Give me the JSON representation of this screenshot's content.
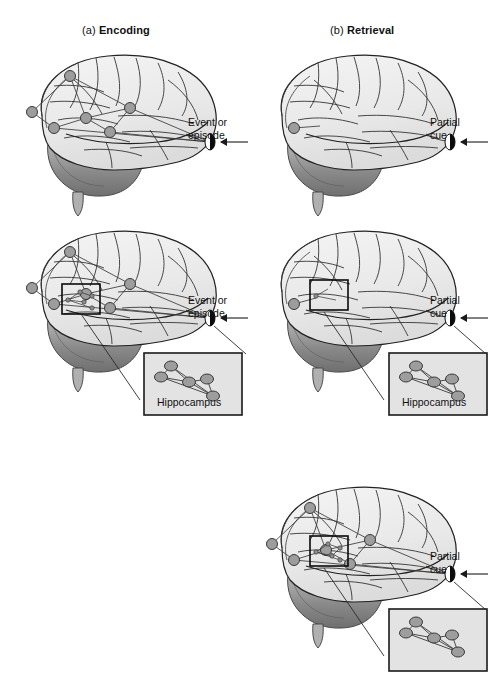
{
  "figure": {
    "type": "diagram",
    "background_color": "#ffffff"
  },
  "columns": [
    {
      "index": "(a)",
      "name": "Encoding",
      "marker_label_line1": "Event or",
      "marker_label_line2": "episode"
    },
    {
      "index": "(b)",
      "name": "Retrieval",
      "marker_label_line1": "Partial",
      "marker_label_line2": "cue"
    }
  ],
  "labels": {
    "hippocampus": "Hippocampus",
    "event_line1": "Event or",
    "event_line2": "episode",
    "partial_line1": "Partial",
    "partial_line2": "cue"
  },
  "colors": {
    "cortex_fill": "#e9e9e9",
    "cortex_fill_light": "#f2f2f2",
    "sulci_stroke": "#2b2b2b",
    "cerebellum_dark": "#7d7d7d",
    "cerebellum_light": "#bdbdbd",
    "node_fill": "#9d9d9d",
    "node_stroke": "#3a3a3a",
    "inset_fill": "#e3e3e3",
    "inset_border": "#1a1a1a",
    "marker_black": "#0b0b0b",
    "arrow": "#1a1a1a",
    "text": "#111111"
  },
  "rows": [
    {
      "id": "row-1",
      "caption": "Cortical network activated by the event; retrieval cue alone",
      "panels": [
        {
          "column": "a",
          "network": "full-cortical",
          "node_count": 6,
          "has_inset": false,
          "marker": "event"
        },
        {
          "column": "b",
          "network": "single-node",
          "node_count": 1,
          "has_inset": false,
          "marker": "partial-cue"
        }
      ]
    },
    {
      "id": "row-2",
      "caption": "Hippocampal index box magnified below each brain",
      "panels": [
        {
          "column": "a",
          "network": "full-cortical",
          "node_count": 6,
          "has_inset": true,
          "marker": "event",
          "inset_nodes": 6
        },
        {
          "column": "b",
          "network": "single-node",
          "node_count": 1,
          "has_inset": true,
          "marker": "partial-cue",
          "inset_nodes": 6
        }
      ]
    },
    {
      "id": "row-3",
      "caption": "Reactivated full cortical network during retrieval",
      "panels": [
        {
          "column": "b",
          "network": "full-cortical",
          "node_count": 6,
          "has_inset": true,
          "marker": "partial-cue",
          "inset_nodes": 6
        }
      ]
    }
  ],
  "hippocampus_inset": {
    "label": "Hippocampus",
    "nodes": [
      {
        "cx": 28,
        "cy": 14
      },
      {
        "cx": 18,
        "cy": 25
      },
      {
        "cx": 46,
        "cy": 30
      },
      {
        "cx": 64,
        "cy": 27
      },
      {
        "cx": 70,
        "cy": 44
      },
      {
        "cx": 52,
        "cy": 36
      }
    ],
    "edges": [
      [
        0,
        1
      ],
      [
        0,
        2
      ],
      [
        0,
        4
      ],
      [
        1,
        2
      ],
      [
        1,
        4
      ],
      [
        2,
        3
      ],
      [
        2,
        4
      ],
      [
        3,
        4
      ]
    ]
  },
  "cortical_network": {
    "nodes": [
      {
        "cx": 52,
        "cy": 30
      },
      {
        "cx": 14,
        "cy": 66
      },
      {
        "cx": 36,
        "cy": 82
      },
      {
        "cx": 68,
        "cy": 72
      },
      {
        "cx": 112,
        "cy": 62
      },
      {
        "cx": 92,
        "cy": 86
      }
    ]
  }
}
